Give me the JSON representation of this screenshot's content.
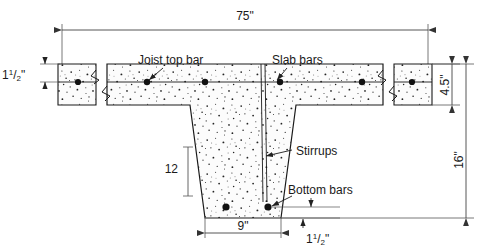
{
  "diagram": {
    "colors": {
      "line": "#1a1a1a",
      "dim_line": "#4a4a4a",
      "concrete_fill": "#fbfbfb",
      "speckle": "#222222",
      "rebar": "#111111",
      "background": "#ffffff"
    },
    "dimensions": {
      "overall_width": "75\"",
      "slab_thickness": "4.5\"",
      "total_depth": "16\"",
      "stem_height": "12",
      "stem_bottom_width": "9\"",
      "top_cover_whole": "1",
      "top_cover_num": "1",
      "top_cover_den": "2",
      "top_cover_unit": "\"",
      "bottom_cover_whole": "1",
      "bottom_cover_num": "1",
      "bottom_cover_den": "2",
      "bottom_cover_unit": "\""
    },
    "annotations": {
      "joist_top_bar": "Joist top bar",
      "slab_bars": "Slab bars",
      "stirrups": "Stirrups",
      "bottom_bars": "Bottom bars"
    }
  }
}
